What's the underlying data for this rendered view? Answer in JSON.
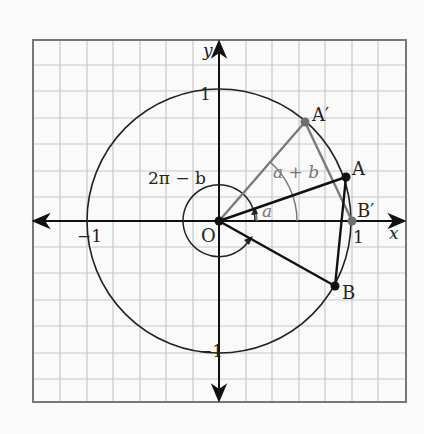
{
  "diagram": {
    "axes": {
      "x_label": "x",
      "y_label": "y",
      "ticks": {
        "x_neg": "−1",
        "x_pos": "1",
        "y_pos": "1",
        "y_neg": "−1"
      }
    },
    "points": {
      "origin": "O",
      "A": "A",
      "A_prime": "A′",
      "B": "B",
      "B_prime": "B′"
    },
    "angles": {
      "a": "a",
      "a_plus_b": "a + b",
      "two_pi_minus_b": "2π − b"
    },
    "colors": {
      "grid": "#c8c8c8",
      "frame": "#777777",
      "primary": "#111111",
      "secondary": "#7a7a7a"
    }
  }
}
